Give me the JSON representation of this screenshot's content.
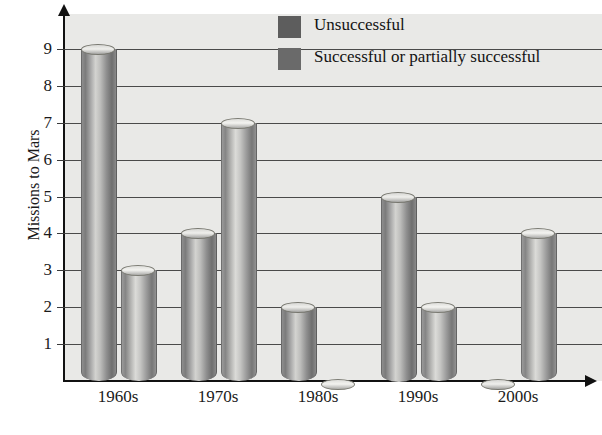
{
  "chart_data": {
    "type": "bar",
    "title": "",
    "xlabel": "",
    "ylabel": "Missions to Mars",
    "categories": [
      "1960s",
      "1970s",
      "1980s",
      "1990s",
      "2000s"
    ],
    "series": [
      {
        "name": "Unsuccessful",
        "values": [
          9,
          4,
          2,
          5,
          0
        ],
        "color": "#5d5d5d"
      },
      {
        "name": "Successful or partially successful",
        "values": [
          3,
          7,
          0,
          2,
          4
        ],
        "color": "#6a6a6a"
      }
    ],
    "ylim": [
      0,
      9.8
    ],
    "yticks": [
      1,
      2,
      3,
      4,
      5,
      6,
      7,
      8,
      9
    ],
    "ytick_labels": [
      "1",
      "2",
      "3",
      "4",
      "5",
      "6",
      "7",
      "8",
      "9"
    ],
    "grid": true,
    "legend_position": "top-center",
    "bar_style": "3d-cylinder",
    "plot_background": "#e9e9e7",
    "gridline_color": "#4a4a4a",
    "axis_color": "#111111"
  },
  "axis": {
    "y_title": "Missions to Mars"
  },
  "legend": {
    "items": [
      {
        "label": "Unsuccessful"
      },
      {
        "label": "Successful or partially successful"
      }
    ]
  },
  "caption": {
    "fragment": ""
  }
}
